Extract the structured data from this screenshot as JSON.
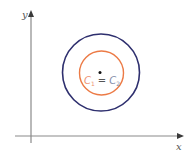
{
  "diagram": {
    "axes": {
      "x_label": "x",
      "y_label": "y",
      "color": "#8a8a8a",
      "arrow_color": "#3a3a3a"
    },
    "circles": [
      {
        "name": "outer-circle",
        "color": "#2e2f6e",
        "cx": 101,
        "cy": 72,
        "r": 38.5
      },
      {
        "name": "inner-circle",
        "color": "#ec7a45",
        "cx": 101,
        "cy": 73,
        "r": 22
      }
    ],
    "center_point": {
      "cx": 100,
      "cy": 72.5,
      "color": "#111111"
    },
    "label": {
      "c1_letter": "C",
      "c1_sub": "1",
      "c1_color": "#ee8f70",
      "equals": "=",
      "equals_color": "#555555",
      "c2_letter": "C",
      "c2_sub": "2",
      "c2_color": "#7f8aa8"
    }
  }
}
